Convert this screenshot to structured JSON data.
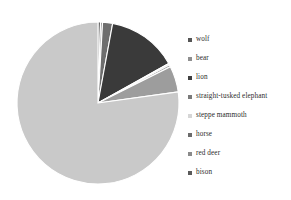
{
  "chart_data": {
    "type": "pie",
    "title": "",
    "subtitle": "",
    "xlabel": "",
    "ylabel": "",
    "legend_position": "right",
    "grid": false,
    "start_angle_deg": 90,
    "direction": "clockwise",
    "categories": [
      "wolf",
      "bear",
      "lion",
      "straight-tusked elephant",
      "steppe mammoth",
      "horse",
      "red deer",
      "bison"
    ],
    "values": [
      0.5,
      0.4,
      2.0,
      14.0,
      0.3,
      0.4,
      5.2,
      77.2
    ],
    "unit": "%",
    "colors": [
      "#555555",
      "#8f8f8f",
      "#6e6e6e",
      "#3a3a3a",
      "#e0e0e0",
      "#a8a8a8",
      "#9d9d9d",
      "#c9c9c9"
    ],
    "series": [
      {
        "name": "share",
        "values": [
          0.5,
          0.4,
          2.0,
          14.0,
          0.3,
          0.4,
          5.2,
          77.2
        ]
      }
    ]
  },
  "legend": {
    "items": [
      {
        "label": "wolf",
        "color": "#555555"
      },
      {
        "label": "bear",
        "color": "#8f8f8f"
      },
      {
        "label": "lion",
        "color": "#3f3f3f"
      },
      {
        "label": "straight-tusked elephant",
        "color": "#7a7a7a"
      },
      {
        "label": "steppe mammoth",
        "color": "#d6d6d6"
      },
      {
        "label": "horse",
        "color": "#6b6b6b"
      },
      {
        "label": "red deer",
        "color": "#8a8a8a"
      },
      {
        "label": "bison",
        "color": "#5a5a5a"
      }
    ]
  },
  "pie": {
    "center_x": 88,
    "center_y": 89,
    "radius": 81,
    "separator_color": "#ffffff",
    "background": "#ffffff"
  }
}
